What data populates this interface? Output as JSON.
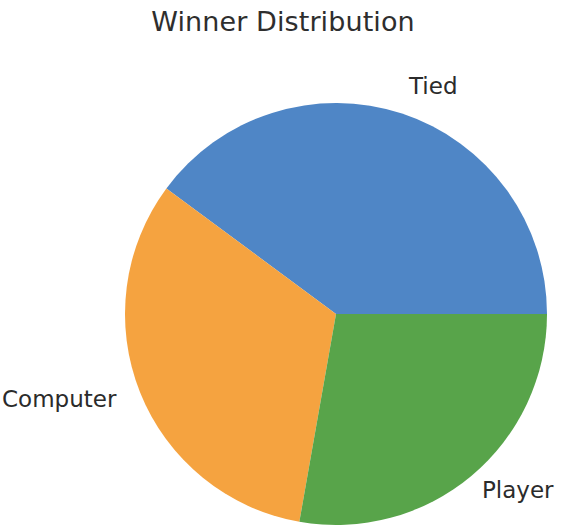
{
  "figure": {
    "title": "Winner Distribution",
    "background": "#ffffff"
  },
  "labels": {
    "tied": "Tied",
    "computer": "Computer",
    "player": "Player"
  },
  "chart_data": {
    "type": "pie",
    "title": "Winner Distribution",
    "categories": [
      "Tied",
      "Computer",
      "Player"
    ],
    "values": [
      39.9,
      32.4,
      27.7
    ],
    "unit": "percent",
    "colors": [
      "#4f86c6",
      "#f5a340",
      "#58a44a"
    ],
    "start_angle": 0,
    "direction": "counterclockwise",
    "wedges": [
      {
        "label": "Tied",
        "color": "#4f86c6",
        "value": 39.9,
        "start_angle_deg": 0,
        "end_angle_deg": 143.5,
        "sweep_deg": 143.5,
        "label_position": "upper-right"
      },
      {
        "label": "Computer",
        "color": "#f5a340",
        "value": 32.4,
        "start_angle_deg": 143.5,
        "end_angle_deg": 260.0,
        "sweep_deg": 116.5,
        "label_position": "left"
      },
      {
        "label": "Player",
        "color": "#58a44a",
        "value": 27.7,
        "start_angle_deg": 260.0,
        "end_angle_deg": 360.0,
        "sweep_deg": 100.0,
        "label_position": "lower-right"
      }
    ],
    "legend": null,
    "grid": false,
    "xlabel": "",
    "ylabel": "",
    "geometry": {
      "center_x": 336,
      "center_y": 314,
      "radius": 211,
      "clipped_bottom": true
    }
  }
}
